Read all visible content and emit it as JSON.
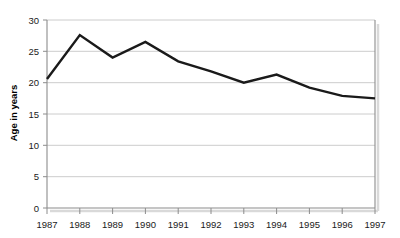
{
  "chart_data": {
    "type": "line",
    "title": "",
    "subtitle": "",
    "xlabel": "",
    "ylabel": "Age in years",
    "categories": [
      "1987",
      "1988",
      "1989",
      "1990",
      "1991",
      "1992",
      "1993",
      "1994",
      "1995",
      "1996",
      "1997"
    ],
    "x": [
      1987,
      1988,
      1989,
      1990,
      1991,
      1992,
      1993,
      1994,
      1995,
      1996,
      1997
    ],
    "values": [
      20.6,
      27.6,
      24.0,
      26.5,
      23.4,
      21.8,
      20.0,
      21.3,
      19.2,
      17.9,
      17.5
    ],
    "series": [
      {
        "name": "Age in years",
        "values": [
          20.6,
          27.6,
          24.0,
          26.5,
          23.4,
          21.8,
          20.0,
          21.3,
          19.2,
          17.9,
          17.5
        ],
        "color": "#1a1a1a"
      }
    ],
    "ylim": [
      0,
      30
    ],
    "xlim": [
      1987,
      1997
    ],
    "yticks": [
      0,
      5,
      10,
      15,
      20,
      25,
      30
    ],
    "ytick_labels": [
      "0",
      "5",
      "10",
      "15",
      "20",
      "25",
      "30"
    ],
    "xtick_labels": [
      "1987",
      "1988",
      "1989",
      "1990",
      "1991",
      "1992",
      "1993",
      "1994",
      "1995",
      "1996",
      "1997"
    ],
    "grid": true,
    "grid_axis": "y",
    "grid_color": "#cccccc",
    "legend": false,
    "legend_position": "none",
    "line_color": "#1a1a1a",
    "line_width": 2.4,
    "axis_color": "#8c8c8c",
    "background_color": "#ffffff",
    "annotations": []
  }
}
